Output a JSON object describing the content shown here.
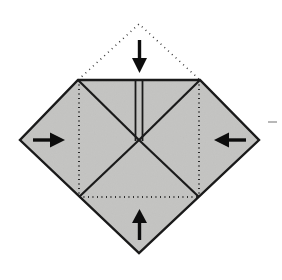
{
  "figure": {
    "canvas": {
      "width": 282,
      "height": 280
    },
    "colors": {
      "paper_fill": "#c9c9c7",
      "edge_stroke": "#1a1a1a",
      "crease_stroke": "#202020",
      "arrow_color": "#0d0d0d",
      "background": "#ffffff",
      "flap_outline": "#303030",
      "tick_mark": "#9a9a9a"
    },
    "geometry": {
      "diamond_points": "139,24 20,140 78,80 200,80 259,140 139,253",
      "paper_polygon": "78,80 200,80 259,140 139,253 20,140",
      "top_left_corner": [
        78,
        80
      ],
      "top_right_corner": [
        200,
        80
      ],
      "left_vertex": [
        20,
        140
      ],
      "right_vertex": [
        259,
        140
      ],
      "bottom_vertex": [
        139,
        253
      ],
      "center_point": [
        139,
        140
      ],
      "flap_apex": [
        139,
        24
      ]
    },
    "creases": {
      "solid": [
        {
          "name": "crease-top-left-to-center",
          "d": "M 78,80 L 139,140"
        },
        {
          "name": "crease-top-right-to-center",
          "d": "M 200,80 L 139,140"
        },
        {
          "name": "crease-center-to-lower-left",
          "d": "M 139,140 L 79,197"
        },
        {
          "name": "crease-center-to-lower-right",
          "d": "M 139,140 L 199,197"
        },
        {
          "name": "crease-top-edge",
          "d": "M 78,80 L 200,80"
        }
      ],
      "double_vertical": {
        "name": "crease-center-vertical-pair",
        "left_x": 135.5,
        "right_x": 142.5,
        "y_top": 80,
        "y_bottom": 141
      },
      "dotted": [
        {
          "name": "fold-line-left-vertical",
          "d": "M 79,80 L 79,197"
        },
        {
          "name": "fold-line-right-vertical",
          "d": "M 199,80 L 199,197"
        },
        {
          "name": "fold-line-bottom-horizontal",
          "d": "M 79,197 L 199,197"
        }
      ],
      "flap": {
        "name": "folded-flap-outline",
        "d": "M 78,80 L 139,24 L 200,80"
      }
    },
    "arrows": [
      {
        "name": "arrow-down-top",
        "direction": "down",
        "label": "fold top flap down",
        "shaft": {
          "x1": 139.5,
          "y1": 40,
          "x2": 139.5,
          "y2": 62
        },
        "head": "132,58 147,58 139.5,73"
      },
      {
        "name": "arrow-right-left-side",
        "direction": "right",
        "label": "fold left point inward to the right",
        "shaft": {
          "x1": 33,
          "y1": 140,
          "x2": 54,
          "y2": 140
        },
        "head": "50,132.5 50,147.5 65,140"
      },
      {
        "name": "arrow-left-right-side",
        "direction": "left",
        "label": "fold right point inward to the left",
        "shaft": {
          "x1": 246,
          "y1": 140,
          "x2": 225,
          "y2": 140
        },
        "head": "229,132.5 229,147.5 214,140"
      },
      {
        "name": "arrow-up-bottom",
        "direction": "up",
        "label": "fold bottom point upward",
        "shaft": {
          "x1": 139.5,
          "y1": 240,
          "x2": 139.5,
          "y2": 219
        },
        "head": "132,223 147,223 139.5,209"
      }
    ],
    "marks": [
      {
        "name": "right-edge-tick-mark",
        "d": "M 268,122 L 277,122"
      }
    ]
  }
}
